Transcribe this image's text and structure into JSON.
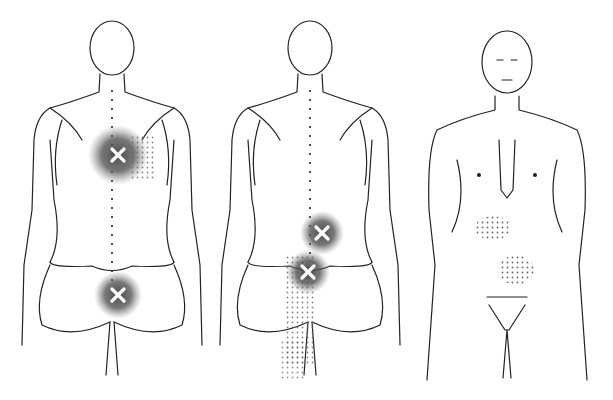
{
  "figure": {
    "colors": {
      "line": "#222222",
      "zone": "#555555",
      "dots": "#777777",
      "marker": "#ffffff",
      "background": "#ffffff"
    },
    "figures": [
      {
        "view": "posterior",
        "trigger_points": [
          {
            "x": 118,
            "y": 155
          },
          {
            "x": 118,
            "y": 295
          }
        ]
      },
      {
        "view": "posterior",
        "trigger_points": [
          {
            "x": 322,
            "y": 233
          },
          {
            "x": 308,
            "y": 272
          }
        ]
      },
      {
        "view": "anterior",
        "trigger_points": [],
        "referred_zones": [
          {
            "x": 493,
            "y": 228
          },
          {
            "x": 516,
            "y": 270
          }
        ]
      }
    ]
  }
}
